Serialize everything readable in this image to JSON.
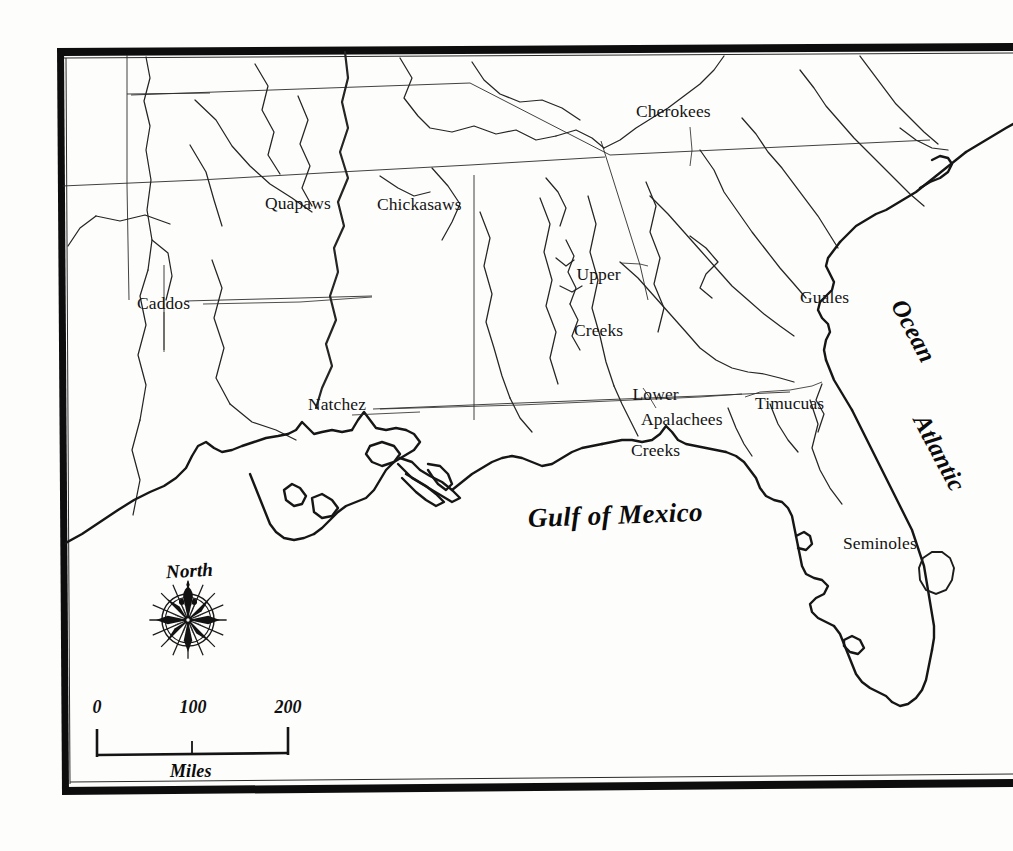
{
  "map": {
    "title": "Southeastern Native American Tribal Territories",
    "background_color": "#fdfdfc",
    "ink_color": "#141414",
    "frame": {
      "present": true,
      "style": "double-rule rectangle",
      "color": "#0d0d0d"
    },
    "water_bodies": [
      {
        "name": "Gulf of Mexico",
        "style": "ornate-italic"
      },
      {
        "name": "Atlantic",
        "style": "ornate-italic-rotated"
      },
      {
        "name": "Ocean",
        "style": "ornate-italic-rotated"
      }
    ],
    "tribe_labels": [
      {
        "name": "Quapaws",
        "lines": [
          "Quapaws"
        ]
      },
      {
        "name": "Chickasaws",
        "lines": [
          "Chickasaws"
        ]
      },
      {
        "name": "Caddos",
        "lines": [
          "Caddos"
        ]
      },
      {
        "name": "Natchez",
        "lines": [
          "Natchez"
        ]
      },
      {
        "name": "Cherokees",
        "lines": [
          "Cherokees"
        ]
      },
      {
        "name": "Upper Creeks",
        "lines": [
          "Upper",
          "Creeks"
        ]
      },
      {
        "name": "Lower Creeks",
        "lines": [
          "Lower",
          "Creeks"
        ]
      },
      {
        "name": "Apalachees",
        "lines": [
          "Apalachees"
        ]
      },
      {
        "name": "Timucuas",
        "lines": [
          "Timucuas"
        ]
      },
      {
        "name": "Guales",
        "lines": [
          "Guales"
        ]
      },
      {
        "name": "Seminoles",
        "lines": [
          "Seminoles"
        ]
      }
    ],
    "labels": {
      "quapaws": "Quapaws",
      "chickasaws": "Chickasaws",
      "caddos": "Caddos",
      "natchez": "Natchez",
      "cherokees": "Cherokees",
      "upper_creeks_line1": "Upper",
      "upper_creeks_line2": "Creeks",
      "lower_creeks_line1": "Lower",
      "lower_creeks_line2": "Creeks",
      "apalachees": "Apalachees",
      "timucuas": "Timucuas",
      "guales": "Guales",
      "seminoles": "Seminoles",
      "gulf_of_mexico": "Gulf of Mexico",
      "atlantic": "Atlantic",
      "ocean": "Ocean"
    },
    "compass": {
      "label": "North",
      "icon": "compass-rose-icon",
      "points": 16,
      "style": "ornate star rose with fleur-de-lis north pointer"
    },
    "scale_bar": {
      "unit_label": "Miles",
      "ticks": [
        "0",
        "100",
        "200"
      ],
      "tick_values": [
        0,
        100,
        200
      ],
      "max_miles": 200
    }
  }
}
